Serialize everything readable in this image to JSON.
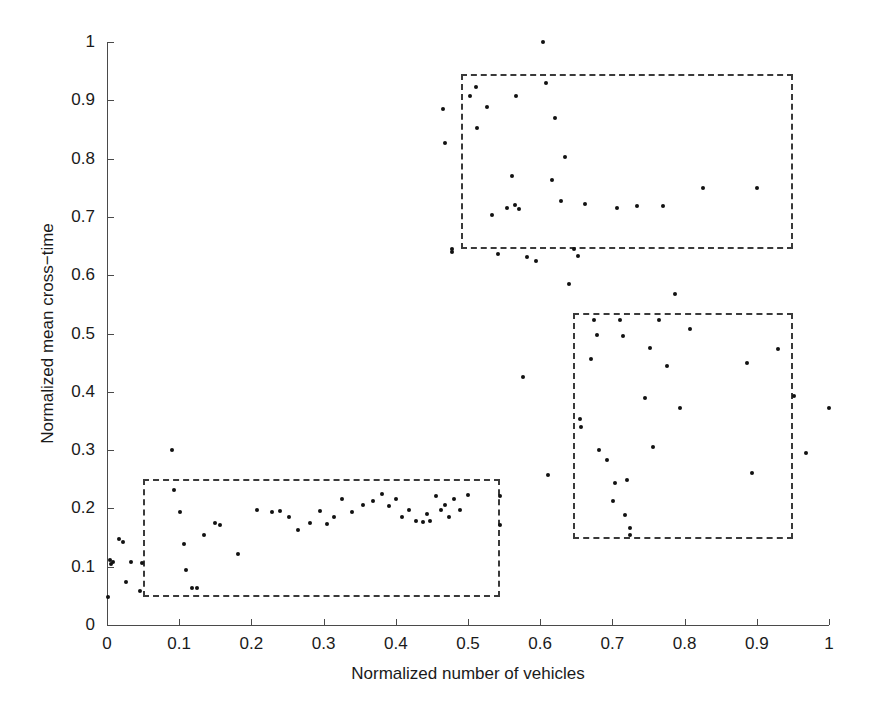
{
  "chart_data": {
    "type": "scatter",
    "title": "",
    "xlabel": "Normalized number of vehicles",
    "ylabel": "Normalized mean cross−time",
    "xlim": [
      0,
      1
    ],
    "ylim": [
      0,
      1
    ],
    "grid": false,
    "legend": null,
    "xticks": [
      0,
      0.1,
      0.2,
      0.3,
      0.4,
      0.5,
      0.6,
      0.7,
      0.8,
      0.9,
      1
    ],
    "xticklabels": [
      "0",
      "0.1",
      "0.2",
      "0.3",
      "0.4",
      "0.5",
      "0.6",
      "0.7",
      "0.8",
      "0.9",
      "1"
    ],
    "yticks": [
      0,
      0.1,
      0.2,
      0.3,
      0.4,
      0.5,
      0.6,
      0.7,
      0.8,
      0.9,
      1
    ],
    "yticklabels": [
      "0",
      "0.1",
      "0.2",
      "0.3",
      "0.4",
      "0.5",
      "0.6",
      "0.7",
      "0.8",
      "0.9",
      "1"
    ],
    "marker": "dot",
    "marker_color": "#111111",
    "series": [
      {
        "name": "observations",
        "points": [
          [
            0.002,
            0.048
          ],
          [
            0.004,
            0.112
          ],
          [
            0.006,
            0.105
          ],
          [
            0.009,
            0.108
          ],
          [
            0.017,
            0.148
          ],
          [
            0.022,
            0.142
          ],
          [
            0.026,
            0.073
          ],
          [
            0.033,
            0.108
          ],
          [
            0.046,
            0.058
          ],
          [
            0.048,
            0.106
          ],
          [
            0.09,
            0.3
          ],
          [
            0.093,
            0.232
          ],
          [
            0.101,
            0.193
          ],
          [
            0.106,
            0.139
          ],
          [
            0.11,
            0.095
          ],
          [
            0.118,
            0.064
          ],
          [
            0.124,
            0.063
          ],
          [
            0.134,
            0.155
          ],
          [
            0.149,
            0.175
          ],
          [
            0.157,
            0.172
          ],
          [
            0.182,
            0.122
          ],
          [
            0.208,
            0.198
          ],
          [
            0.228,
            0.193
          ],
          [
            0.24,
            0.196
          ],
          [
            0.252,
            0.185
          ],
          [
            0.264,
            0.163
          ],
          [
            0.281,
            0.175
          ],
          [
            0.295,
            0.196
          ],
          [
            0.305,
            0.173
          ],
          [
            0.314,
            0.186
          ],
          [
            0.326,
            0.216
          ],
          [
            0.339,
            0.193
          ],
          [
            0.355,
            0.206
          ],
          [
            0.368,
            0.212
          ],
          [
            0.381,
            0.225
          ],
          [
            0.39,
            0.204
          ],
          [
            0.4,
            0.216
          ],
          [
            0.408,
            0.186
          ],
          [
            0.418,
            0.198
          ],
          [
            0.428,
            0.178
          ],
          [
            0.437,
            0.176
          ],
          [
            0.443,
            0.19
          ],
          [
            0.448,
            0.178
          ],
          [
            0.455,
            0.222
          ],
          [
            0.463,
            0.197
          ],
          [
            0.468,
            0.205
          ],
          [
            0.473,
            0.185
          ],
          [
            0.481,
            0.216
          ],
          [
            0.489,
            0.198
          ],
          [
            0.5,
            0.223
          ],
          [
            0.544,
            0.222
          ],
          [
            0.545,
            0.172
          ],
          [
            0.466,
            0.885
          ],
          [
            0.468,
            0.826
          ],
          [
            0.478,
            0.645
          ],
          [
            0.478,
            0.639
          ],
          [
            0.503,
            0.907
          ],
          [
            0.511,
            0.923
          ],
          [
            0.513,
            0.852
          ],
          [
            0.526,
            0.889
          ],
          [
            0.533,
            0.703
          ],
          [
            0.541,
            0.636
          ],
          [
            0.554,
            0.716
          ],
          [
            0.561,
            0.771
          ],
          [
            0.565,
            0.721
          ],
          [
            0.567,
            0.907
          ],
          [
            0.571,
            0.714
          ],
          [
            0.576,
            0.426
          ],
          [
            0.582,
            0.631
          ],
          [
            0.594,
            0.625
          ],
          [
            0.604,
            1.0
          ],
          [
            0.608,
            0.93
          ],
          [
            0.611,
            0.258
          ],
          [
            0.617,
            0.763
          ],
          [
            0.62,
            0.869
          ],
          [
            0.629,
            0.727
          ],
          [
            0.635,
            0.803
          ],
          [
            0.64,
            0.585
          ],
          [
            0.647,
            0.645
          ],
          [
            0.652,
            0.633
          ],
          [
            0.655,
            0.353
          ],
          [
            0.656,
            0.34
          ],
          [
            0.662,
            0.722
          ],
          [
            0.67,
            0.456
          ],
          [
            0.674,
            0.523
          ],
          [
            0.678,
            0.498
          ],
          [
            0.682,
            0.301
          ],
          [
            0.692,
            0.283
          ],
          [
            0.701,
            0.213
          ],
          [
            0.703,
            0.244
          ],
          [
            0.707,
            0.715
          ],
          [
            0.711,
            0.523
          ],
          [
            0.715,
            0.496
          ],
          [
            0.717,
            0.188
          ],
          [
            0.72,
            0.249
          ],
          [
            0.724,
            0.167
          ],
          [
            0.725,
            0.155
          ],
          [
            0.734,
            0.718
          ],
          [
            0.745,
            0.389
          ],
          [
            0.752,
            0.475
          ],
          [
            0.756,
            0.306
          ],
          [
            0.764,
            0.524
          ],
          [
            0.77,
            0.718
          ],
          [
            0.775,
            0.444
          ],
          [
            0.787,
            0.568
          ],
          [
            0.793,
            0.372
          ],
          [
            0.808,
            0.508
          ],
          [
            0.825,
            0.749
          ],
          [
            0.886,
            0.449
          ],
          [
            0.893,
            0.261
          ],
          [
            0.9,
            0.749
          ],
          [
            0.93,
            0.474
          ],
          [
            0.952,
            0.393
          ],
          [
            0.968,
            0.295
          ],
          [
            1.0,
            0.372
          ]
        ]
      }
    ],
    "annotations": {
      "cluster_boxes": [
        {
          "name": "low-cluster-box",
          "x0": 0.05,
          "y0": 0.048,
          "x1": 0.545,
          "y1": 0.25
        },
        {
          "name": "high-cluster-box",
          "x0": 0.49,
          "y0": 0.645,
          "x1": 0.95,
          "y1": 0.945
        },
        {
          "name": "mid-cluster-box",
          "x0": 0.645,
          "y0": 0.148,
          "x1": 0.95,
          "y1": 0.535
        }
      ],
      "style": "dashed-rectangle",
      "color": "#3a3a3a"
    }
  }
}
